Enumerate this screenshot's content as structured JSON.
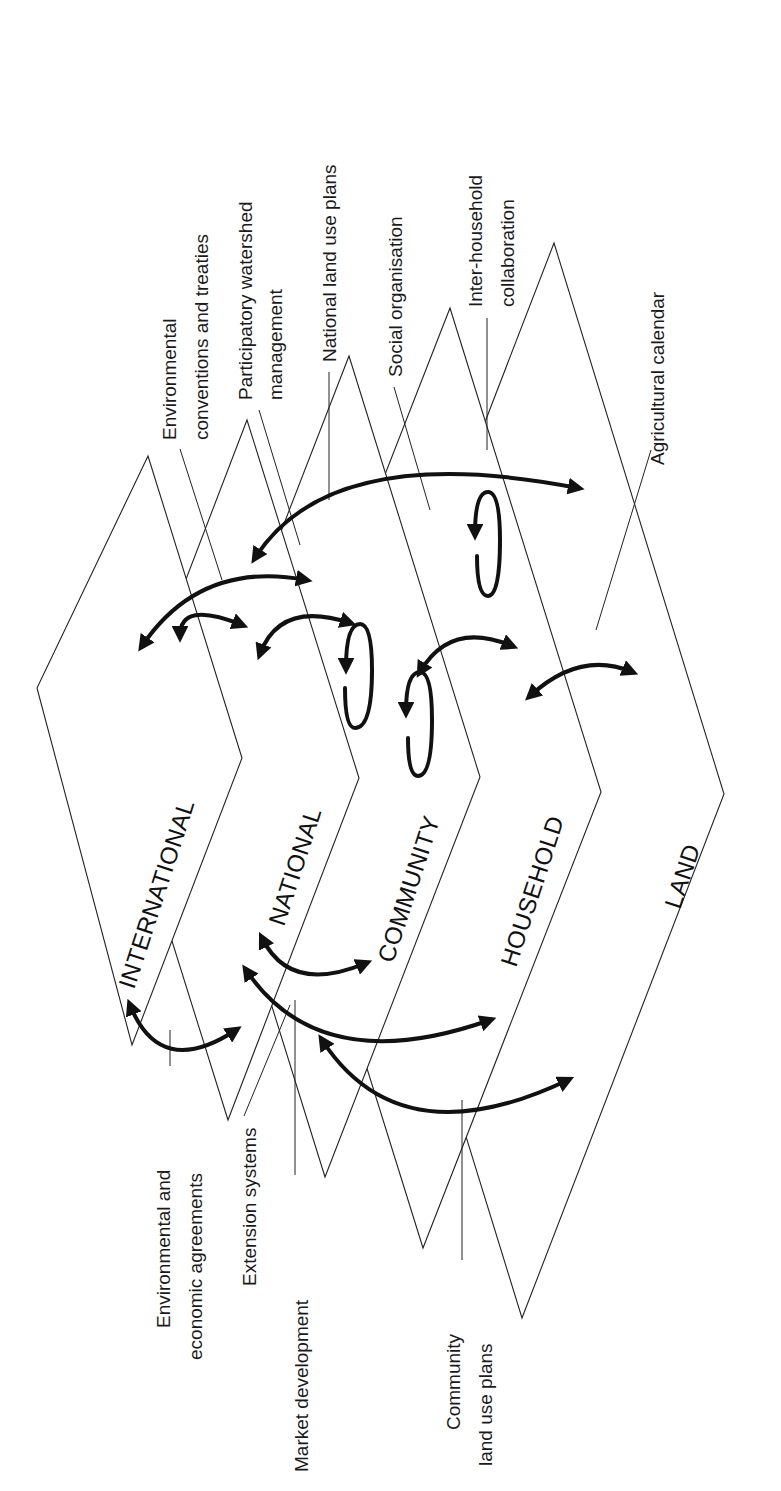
{
  "levels": [
    {
      "name": "INTERNATIONAL"
    },
    {
      "name": "NATIONAL"
    },
    {
      "name": "COMMUNITY"
    },
    {
      "name": "HOUSEHOLD"
    },
    {
      "name": "LAND"
    }
  ],
  "labels_top": {
    "env_conventions_1": "Environmental",
    "env_conventions_2": "conventions and treaties",
    "participatory_1": "Participatory watershed",
    "participatory_2": "management",
    "national_land_use": "National land use plans",
    "social_org": "Social organisation",
    "inter_household_1": "Inter-household",
    "inter_household_2": "collaboration",
    "agri_calendar": "Agricultural calendar"
  },
  "labels_bottom": {
    "env_agreements_1": "Environmental and",
    "env_agreements_2": "economic agreements",
    "extension": "Extension systems",
    "market": "Market development",
    "community_plans_1": "Community",
    "community_plans_2": "land use plans"
  }
}
